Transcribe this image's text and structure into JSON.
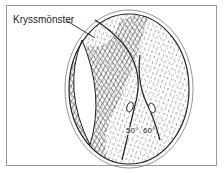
{
  "diagram": {
    "callout_label": "Kryssmönster",
    "angle_labels": [
      "50°",
      "60°"
    ],
    "colors": {
      "line": "#222222",
      "frame": "#9a9a9a",
      "background": "#ffffff"
    }
  }
}
